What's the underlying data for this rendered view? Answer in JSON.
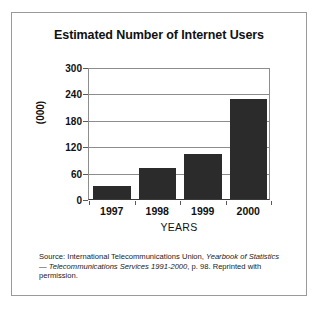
{
  "figure": {
    "title": "Estimated Number of Internet Users",
    "source_note": {
      "prefix": "Source: International Telecommunications Union, ",
      "italic_1": "Yearbook of Statistics",
      "middle": " — ",
      "italic_2": "Telecommunications Services 1991-2000",
      "suffix": ", p. 98. Reprinted with permission."
    },
    "border_color": "#9a9a9a",
    "background": "#ffffff"
  },
  "chart_data": {
    "type": "bar",
    "title": "Estimated Number of Internet Users",
    "categories": [
      "1997",
      "1998",
      "1999",
      "2000"
    ],
    "values": [
      32,
      72,
      105,
      230
    ],
    "xlabel": "YEARS",
    "ylabel": "(000)",
    "ylim": [
      0,
      300
    ],
    "yticks": [
      0,
      60,
      120,
      180,
      240,
      300
    ],
    "ytick_labels": [
      "0",
      "60",
      "120",
      "180",
      "240",
      "300"
    ],
    "grid": true,
    "legend": false,
    "bar_color": "#2b2b2b",
    "axis_color": "#8d8d8d"
  }
}
